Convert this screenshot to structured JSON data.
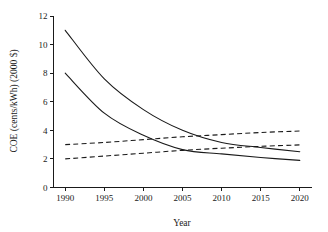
{
  "chart_data": {
    "type": "line",
    "title": "",
    "subtitle": "",
    "xlabel": "Year",
    "ylabel": "COE (cents/kWh) (2000 $)",
    "xlim": [
      1988.5,
      2021.5
    ],
    "ylim": [
      0,
      12
    ],
    "xticks": [
      1990,
      1995,
      2000,
      2005,
      2010,
      2015,
      2020
    ],
    "xtick_labels": [
      "1990",
      "1995",
      "2000",
      "2005",
      "2010",
      "2015",
      "2020"
    ],
    "yticks": [
      0,
      2,
      4,
      6,
      8,
      10,
      12
    ],
    "ytick_labels": [
      "0",
      "2",
      "4",
      "6",
      "8",
      "10",
      "12"
    ],
    "grid": false,
    "legend": false,
    "legend_position": "none",
    "line_color": "#1a1a1a",
    "x": [
      1990,
      1995,
      2000,
      2005,
      2010,
      2015,
      2020
    ],
    "series": [
      {
        "name": "upper-solid-declining",
        "style": "solid",
        "values": [
          11.0,
          7.6,
          5.45,
          4.0,
          3.15,
          2.8,
          2.5
        ]
      },
      {
        "name": "lower-solid-declining",
        "style": "solid",
        "values": [
          8.0,
          5.2,
          3.65,
          2.65,
          2.35,
          2.1,
          1.9
        ]
      },
      {
        "name": "upper-dashed-rising",
        "style": "dashed",
        "values": [
          3.0,
          3.15,
          3.35,
          3.55,
          3.7,
          3.85,
          3.95
        ]
      },
      {
        "name": "lower-dashed-rising",
        "style": "dashed",
        "values": [
          2.0,
          2.2,
          2.4,
          2.6,
          2.75,
          2.88,
          2.98
        ]
      }
    ]
  },
  "axes": {
    "y_axis_title": "COE (cents/kWh) (2000 $)",
    "x_axis_title": "Year"
  }
}
